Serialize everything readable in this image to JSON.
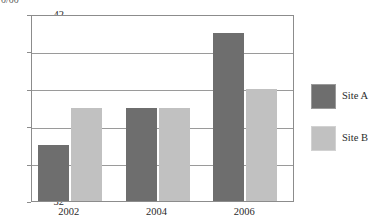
{
  "top_fragment": {
    "text": "0/00"
  },
  "chart_data": {
    "type": "bar",
    "title": "",
    "subtitle": "",
    "xlabel": "",
    "ylabel": "",
    "categories": [
      "2002",
      "2004",
      "2006"
    ],
    "series": [
      {
        "name": "Site A",
        "values": [
          35,
          37,
          41
        ],
        "color": "#6e6e6e"
      },
      {
        "name": "Site B",
        "values": [
          37,
          37,
          38
        ],
        "color": "#c1c1c1"
      }
    ],
    "ylim": [
      32,
      42
    ],
    "yticks": [
      42,
      40,
      38,
      36,
      34,
      32
    ],
    "ytick_labels": [
      "42",
      "40",
      "38",
      "36",
      "34",
      "32"
    ],
    "xtick_labels": [
      "2002",
      "2004",
      "2006"
    ],
    "grid": true,
    "grid_axis": "y",
    "legend": {
      "position": "right",
      "entries": [
        {
          "label": "Site A",
          "color": "#6e6e6e"
        },
        {
          "label": "Site B",
          "color": "#c1c1c1"
        }
      ]
    },
    "frame_color": "#8c8c8c",
    "background": "#ffffff"
  }
}
